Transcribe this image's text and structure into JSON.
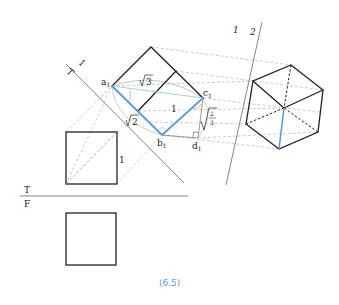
{
  "figure": {
    "caption": "(6.5)",
    "colors": {
      "accent_blue": "#5b9bd5",
      "light_blue": "#a9cdee",
      "edge": "#222222",
      "projection": "#aaaaaa"
    }
  },
  "fold_lines": {
    "top_front": {
      "upper_label": "T",
      "lower_label": "F"
    },
    "top_aux1": {
      "upper_label": "1",
      "lower_label": "T"
    },
    "aux1_aux2": {
      "left_label": "1",
      "right_label": "2"
    }
  },
  "top_view": {
    "edge_label": "1"
  },
  "aux_view_1": {
    "points": {
      "a": "a",
      "b": "b",
      "c": "c",
      "d": "d",
      "subscript": "1"
    },
    "labels": {
      "ac_length": "3",
      "ab_length": "2",
      "bc_length": "1",
      "cd_num": "2",
      "cd_den": "3"
    }
  },
  "aux_view_2": {
    "shape": "hexagon (cube along diagonal)"
  }
}
